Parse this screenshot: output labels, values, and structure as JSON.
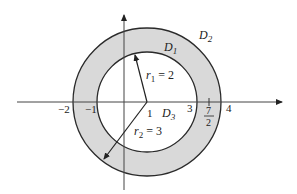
{
  "figure": {
    "colors": {
      "annulus_fill": "#d9d9d9",
      "stroke": "#2a2a2a",
      "background": "#ffffff"
    },
    "regions": {
      "outer": "D",
      "outer_sub": "2",
      "annulus": "D",
      "annulus_sub": "1",
      "inner": "D",
      "inner_sub": "3"
    },
    "radii": {
      "r1_symbol": "r",
      "r1_sub": "1",
      "r1_value": " = 2",
      "r2_symbol": "r",
      "r2_sub": "2",
      "r2_value": " = 3"
    },
    "axis_ticks": {
      "neg2": "−2",
      "neg1": "−1",
      "center": "1",
      "three": "3",
      "seven_half_num": "7",
      "seven_half_den": "2",
      "four": "4"
    }
  }
}
